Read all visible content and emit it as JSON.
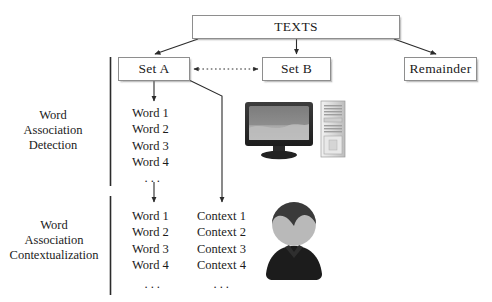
{
  "diagram": {
    "title_node": {
      "label": "TEXTS"
    },
    "nodes": [
      {
        "id": "set_a",
        "label": "Set A"
      },
      {
        "id": "set_b",
        "label": "Set B"
      },
      {
        "id": "remainder",
        "label": "Remainder"
      }
    ],
    "stages": [
      {
        "id": "detection",
        "lines": [
          "Word",
          "Association",
          "Detection"
        ]
      },
      {
        "id": "contextualization",
        "lines": [
          "Word",
          "Association",
          "Contextualization"
        ]
      }
    ],
    "word_list_top": [
      "Word 1",
      "Word 2",
      "Word 3",
      "Word 4"
    ],
    "word_list_bottom": [
      "Word 1",
      "Word 2",
      "Word 3",
      "Word 4"
    ],
    "context_list": [
      "Context 1",
      "Context 2",
      "Context 3",
      "Context 4"
    ],
    "ellipsis": "···",
    "icons": [
      {
        "id": "computer",
        "name": "desktop-computer-illustration"
      },
      {
        "id": "person",
        "name": "person-avatar-illustration"
      }
    ],
    "colors": {
      "box_border": "#8e8e8e",
      "arrow": "#2b2b2b",
      "text": "#1b1b1b",
      "background": "#ffffff",
      "screen_dark": "#6f6f6f",
      "screen_light": "#b4b4b4",
      "tower_light": "#d9d9d9",
      "person_hair": "#3a3a3a",
      "person_face": "#b9b9b9",
      "person_body": "#1c1c1c"
    }
  },
  "stage_text": {
    "detection_l1": "Word",
    "detection_l2": "Association",
    "detection_l3": "Detection",
    "context_l1": "Word",
    "context_l2": "Association",
    "context_l3": "Contextualization"
  }
}
